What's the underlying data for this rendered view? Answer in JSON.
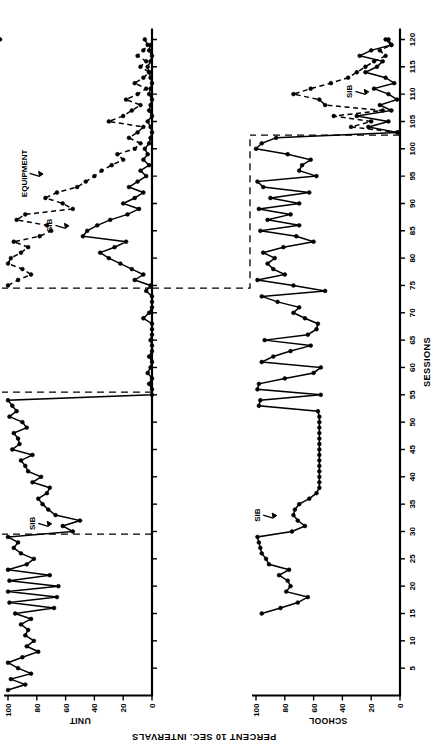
{
  "figure": {
    "orientation": "rotated-90-ccw",
    "background": "#ffffff",
    "ink": "#000000"
  },
  "axes": {
    "x_title": "SESSIONS",
    "y_title": "PERCENT 10 SEC. INTERVALS",
    "x_ticks": [
      5,
      10,
      15,
      20,
      25,
      30,
      35,
      40,
      45,
      50,
      55,
      60,
      65,
      70,
      75,
      80,
      85,
      90,
      95,
      100,
      105,
      110,
      115,
      120
    ],
    "y_ticks": [
      0,
      20,
      40,
      60,
      80,
      100
    ],
    "xlim": [
      0,
      122
    ],
    "ylim": [
      0,
      104
    ],
    "grid": false
  },
  "panels": [
    {
      "id": "unit",
      "label": "UNIT",
      "phases": [
        {
          "name": "BASELINE",
          "label": "BASELINE",
          "start": 1,
          "end": 29
        },
        {
          "name": "verbal-reprimand",
          "label": "VERBAL REPRIMAND +\nREINFORCED TOY PLAY",
          "start": 30,
          "end": 55
        },
        {
          "name": "continuous-protective-equipment",
          "label": "CONTINUOUS\nPROTECTIVE\nEQUIPMENT",
          "start": 56,
          "end": 74
        },
        {
          "name": "equipment-timeout",
          "label": "EQUIPMENT/TIMEOUT\n+ SENS STIM TOY PLAY",
          "start": 75,
          "end": 120
        }
      ],
      "phase_dividers": [
        29.5,
        55.5,
        74.5
      ],
      "annotations": [
        {
          "text": "SIB",
          "session": 31.5,
          "value": 70
        },
        {
          "text": "SIB",
          "session": 86,
          "value": 58
        },
        {
          "text": "EQUIPMENT",
          "session": 95.5,
          "value": 76
        }
      ]
    },
    {
      "id": "school",
      "label": "SCHOOL",
      "phases": [
        {
          "name": "baseline-school",
          "label": "",
          "start": 15,
          "end": 102
        },
        {
          "name": "equipment-timeout-school",
          "label": "",
          "start": 103,
          "end": 120
        }
      ],
      "phase_dividers": [
        102.5
      ],
      "annotations": [
        {
          "text": "SIB",
          "session": 33,
          "value": 86
        },
        {
          "text": "SIB",
          "session": 110.5,
          "value": 22
        }
      ]
    }
  ],
  "chart_data": {
    "type": "line",
    "title": "",
    "subtitle": "",
    "xlabel": "SESSIONS",
    "ylabel": "PERCENT 10 SEC. INTERVALS",
    "xlim": [
      0,
      122
    ],
    "ylim": [
      0,
      104
    ],
    "grid": false,
    "legend": [
      "SIB",
      "EQUIPMENT"
    ],
    "legend_position": "inline-annotation",
    "panels": [
      {
        "name": "UNIT",
        "series": [
          {
            "name": "SIB",
            "style": "solid",
            "x": [
              1,
              2,
              3,
              4,
              5,
              6,
              7,
              8,
              9,
              10,
              11,
              12,
              13,
              14,
              15,
              16,
              17,
              18,
              19,
              20,
              21,
              22,
              23,
              24,
              25,
              26,
              27,
              28,
              29,
              30,
              31,
              32,
              33,
              34,
              35,
              36,
              37,
              38,
              39,
              40,
              41,
              42,
              43,
              44,
              45,
              46,
              47,
              48,
              49,
              50,
              51,
              52,
              53,
              54,
              55,
              56,
              57,
              58,
              59,
              60,
              61,
              62,
              63,
              64,
              65,
              66,
              67,
              68,
              69,
              70,
              71,
              72,
              73,
              74,
              75,
              76,
              77,
              78,
              79,
              80,
              81,
              82,
              83,
              84,
              85,
              86,
              87,
              88,
              89,
              90,
              91,
              92,
              93,
              94,
              95,
              96,
              97,
              98,
              99,
              100,
              101,
              102,
              103,
              104,
              105,
              106,
              107,
              108,
              109,
              110,
              111,
              112,
              113,
              114,
              115,
              116,
              117,
              118,
              119,
              120
            ],
            "y": [
              100,
              88,
              98,
              84,
              93,
              100,
              90,
              79,
              87,
              82,
              88,
              86,
              91,
              84,
              95,
              68,
              99,
              66,
              100,
              65,
              99,
              71,
              100,
              87,
              82,
              91,
              96,
              93,
              100,
              55,
              62,
              50,
              67,
              72,
              76,
              79,
              73,
              71,
              83,
              77,
              86,
              88,
              91,
              83,
              97,
              92,
              93,
              96,
              87,
              90,
              99,
              94,
              97,
              100,
              0,
              0,
              2,
              0,
              3,
              1,
              0,
              2,
              0,
              0,
              1,
              0,
              0,
              0,
              6,
              2,
              0,
              0,
              0,
              4,
              1,
              12,
              6,
              14,
              22,
              30,
              36,
              26,
              18,
              48,
              45,
              38,
              29,
              17,
              9,
              20,
              12,
              6,
              16,
              10,
              4,
              8,
              2,
              6,
              3,
              5,
              2,
              1,
              0,
              1,
              3,
              0,
              2,
              1,
              0,
              2,
              1,
              0,
              1,
              2,
              3,
              1,
              0,
              2,
              1
            ]
          },
          {
            "name": "EQUIPMENT",
            "style": "dashed",
            "x": [
              75,
              76,
              77,
              78,
              79,
              80,
              81,
              82,
              83,
              84,
              85,
              86,
              87,
              88,
              89,
              90,
              91,
              92,
              93,
              94,
              95,
              96,
              97,
              98,
              99,
              100,
              101,
              102,
              103,
              104,
              105,
              106,
              107,
              108,
              109,
              110,
              111,
              112,
              113,
              114,
              115,
              116,
              117,
              118,
              119,
              120
            ],
            "y": [
              100,
              93,
              84,
              90,
              100,
              98,
              91,
              86,
              96,
              78,
              70,
              73,
              94,
              88,
              55,
              62,
              74,
              66,
              52,
              46,
              40,
              35,
              28,
              20,
              24,
              12,
              8,
              16,
              10,
              6,
              30,
              20,
              14,
              8,
              18,
              10,
              4,
              12,
              6,
              2,
              8,
              4,
              10,
              6,
              3,
              5
            ]
          }
        ]
      },
      {
        "name": "SCHOOL",
        "series": [
          {
            "name": "SIB",
            "style": "solid",
            "x": [
              15,
              16,
              17,
              18,
              19,
              20,
              21,
              22,
              23,
              24,
              25,
              26,
              27,
              28,
              29,
              30,
              31,
              32,
              33,
              34,
              35,
              36,
              37,
              38,
              39,
              40,
              41,
              42,
              43,
              44,
              45,
              46,
              47,
              48,
              49,
              50,
              51,
              52,
              53,
              54,
              55,
              56,
              57,
              58,
              59,
              60,
              61,
              62,
              63,
              64,
              65,
              66,
              67,
              68,
              69,
              70,
              71,
              72,
              73,
              74,
              75,
              76,
              77,
              78,
              79,
              80,
              81,
              82,
              83,
              84,
              85,
              86,
              87,
              88,
              89,
              90,
              91,
              92,
              93,
              94,
              95,
              96,
              97,
              98,
              99,
              100,
              101,
              102,
              103,
              104,
              105,
              106,
              107,
              108,
              109,
              110,
              111,
              112,
              113,
              114,
              115,
              116,
              117,
              118,
              119,
              120
            ],
            "y": [
              96,
              83,
              71,
              64,
              79,
              76,
              78,
              84,
              77,
              91,
              93,
              96,
              97,
              98,
              99,
              75,
              66,
              71,
              74,
              73,
              70,
              63,
              58,
              56,
              56,
              56,
              56,
              56,
              56,
              56,
              56,
              56,
              56,
              56,
              56,
              56,
              56,
              57,
              98,
              97,
              55,
              99,
              98,
              80,
              60,
              55,
              96,
              88,
              76,
              62,
              94,
              64,
              58,
              57,
              66,
              74,
              70,
              85,
              96,
              52,
              74,
              99,
              80,
              88,
              92,
              87,
              95,
              81,
              60,
              72,
              97,
              70,
              92,
              76,
              98,
              70,
              90,
              63,
              95,
              99,
              58,
              70,
              68,
              62,
              78,
              100,
              96,
              86,
              2,
              22,
              8,
              30,
              6,
              14,
              2,
              8,
              18,
              4,
              10,
              24,
              16,
              12,
              28,
              20,
              6,
              10
            ]
          },
          {
            "name": "EQUIPMENT",
            "style": "dashed",
            "x": [
              103,
              104,
              105,
              106,
              107,
              108,
              109,
              110,
              111,
              112,
              113,
              114,
              115,
              116,
              117,
              118,
              119,
              120
            ],
            "y": [
              1,
              34,
              20,
              46,
              12,
              52,
              56,
              74,
              62,
              48,
              36,
              30,
              24,
              18,
              10,
              14,
              6,
              8
            ]
          }
        ]
      }
    ]
  }
}
